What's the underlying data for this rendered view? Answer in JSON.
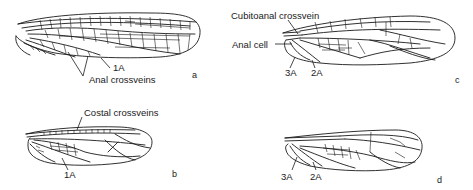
{
  "figure": {
    "panels": [
      {
        "id": "a",
        "letter": "a",
        "labels": {
          "vein_1a": "1A",
          "anal_crossveins": "Anal crossveins"
        }
      },
      {
        "id": "b",
        "letter": "b",
        "labels": {
          "costal_crossveins": "Costal crossveins",
          "vein_1a": "1A"
        }
      },
      {
        "id": "c",
        "letter": "c",
        "labels": {
          "cubitoanal_crossvein": "Cubitoanal crossvein",
          "anal_cell": "Anal cell",
          "vein_3a": "3A",
          "vein_2a": "2A"
        }
      },
      {
        "id": "d",
        "letter": "d",
        "labels": {
          "vein_3a": "3A",
          "vein_2a": "2A"
        }
      }
    ],
    "colors": {
      "ink": "#1a1a1a",
      "background": "#ffffff"
    }
  }
}
